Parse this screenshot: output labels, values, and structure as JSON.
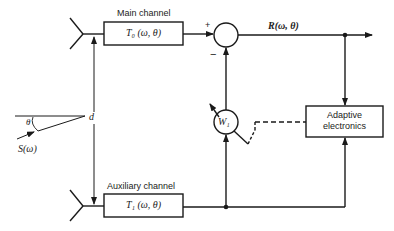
{
  "diagram": {
    "main_channel": {
      "title": "Main channel",
      "transfer": "T₀ (ω, θ)"
    },
    "aux_channel": {
      "title": "Auxiliary channel",
      "transfer": "T₁ (ω, θ)"
    },
    "summer": {
      "plus": "+",
      "minus": "−"
    },
    "output": {
      "label": "R(ω, θ)"
    },
    "weight": {
      "label": "W₁"
    },
    "adaptive": {
      "line1": "Adaptive",
      "line2": "electronics"
    },
    "spacing": {
      "label": "d"
    },
    "signal": {
      "angle": "θ",
      "source": "S(ω)"
    }
  },
  "colors": {
    "line": "#1a1a1a",
    "background": "#ffffff"
  }
}
